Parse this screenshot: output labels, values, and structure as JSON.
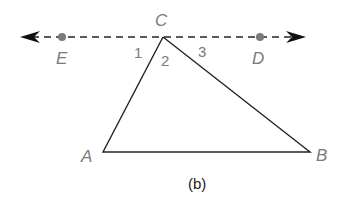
{
  "diagram": {
    "caption": "(b)",
    "points": {
      "A": "A",
      "B": "B",
      "C": "C",
      "D": "D",
      "E": "E"
    },
    "angles": {
      "one": "1",
      "two": "2",
      "three": "3"
    },
    "colors": {
      "line": "#222222",
      "label": "#7a7a7a",
      "dot": "#7a7a7a"
    }
  }
}
